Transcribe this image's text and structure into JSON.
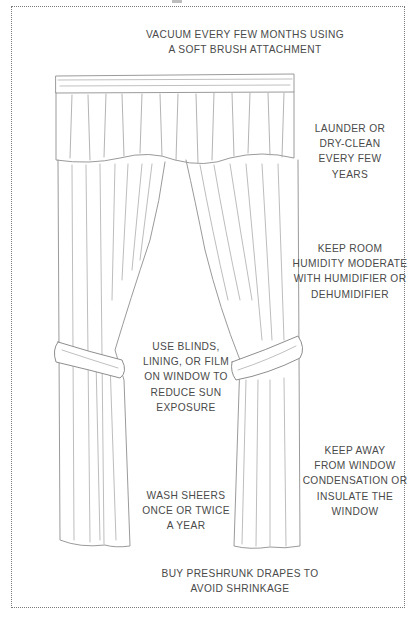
{
  "diagram": {
    "colors": {
      "text": "#4a4a4a",
      "border": "#7a7a7a",
      "sketch": "#9a9a9a",
      "background": "#ffffff"
    },
    "tips": {
      "vacuum": {
        "lines": [
          "Vacuum every few months using",
          "a soft brush attachment"
        ]
      },
      "launder": {
        "lines": [
          "Launder or",
          "dry-clean",
          "every few",
          "years"
        ]
      },
      "humidity": {
        "lines": [
          "Keep room",
          "humidity moderate",
          "with humidifier or",
          "dehumidifier"
        ]
      },
      "blinds": {
        "lines": [
          "Use blinds,",
          "lining, or film",
          "on window to",
          "reduce sun",
          "exposure"
        ]
      },
      "condensation": {
        "lines": [
          "Keep away",
          "from window",
          "condensation or",
          "insulate the",
          "window"
        ]
      },
      "sheers": {
        "lines": [
          "Wash sheers",
          "once or twice",
          "a year"
        ]
      },
      "preshrunk": {
        "lines": [
          "Buy preshrunk drapes to",
          "avoid shrinkage"
        ]
      }
    }
  }
}
